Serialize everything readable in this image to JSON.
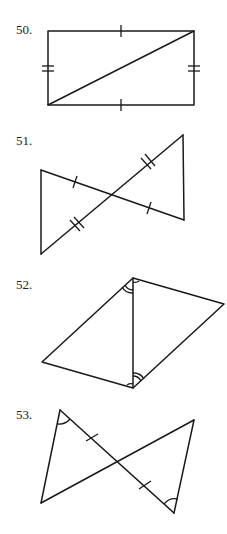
{
  "figures": [
    {
      "number": "50.",
      "shape": "rectangle with diagonal",
      "marks": "opposite sides congruent (single tick top/bottom, double tick left/right)"
    },
    {
      "number": "51.",
      "shape": "two triangles with vertical angles",
      "marks": "segments bisected (single ticks and double ticks)"
    },
    {
      "number": "52.",
      "shape": "quadrilateral with diagonal",
      "marks": "alternate interior angles congruent (double arcs)"
    },
    {
      "number": "53.",
      "shape": "two triangles with crossing segments",
      "marks": "one pair of congruent segments (single ticks), one pair of congruent angles (single arcs)"
    }
  ],
  "colors": {
    "stroke": "#1a1a1a",
    "background": "#ffffff"
  }
}
